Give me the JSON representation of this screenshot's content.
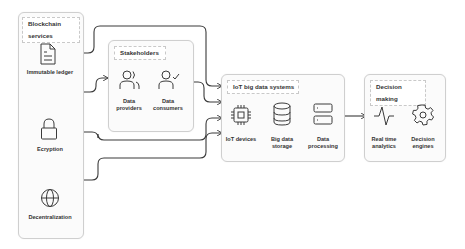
{
  "diagram": {
    "colors": {
      "line": "#3a3a3a",
      "box_border": "#cfcfcf",
      "box_fill": "#fbfbfb",
      "icon": "#3a3a3a"
    },
    "blockchain": {
      "title": "Blockchain services",
      "items": [
        {
          "label": "Immutable ledger",
          "icon": "document-icon"
        },
        {
          "label": "Ecryption",
          "icon": "lock-icon"
        },
        {
          "label": "Decentralization",
          "icon": "globe-icon"
        }
      ]
    },
    "stakeholders": {
      "title": "Stakeholders",
      "items": [
        {
          "label": "Data\nproviders",
          "icon": "users-icon"
        },
        {
          "label": "Data\nconsumers",
          "icon": "user-check-icon"
        }
      ]
    },
    "iot": {
      "title": "IoT big data systems",
      "items": [
        {
          "label": "IoT devices",
          "icon": "chip-icon"
        },
        {
          "label": "Big data\nstorage",
          "icon": "database-icon"
        },
        {
          "label": "Data\nprocessing",
          "icon": "server-icon"
        }
      ]
    },
    "decision": {
      "title": "Decision making",
      "items": [
        {
          "label": "Real time\nanalytics",
          "icon": "pulse-icon"
        },
        {
          "label": "Decision\nengines",
          "icon": "gear-icon"
        }
      ]
    }
  }
}
